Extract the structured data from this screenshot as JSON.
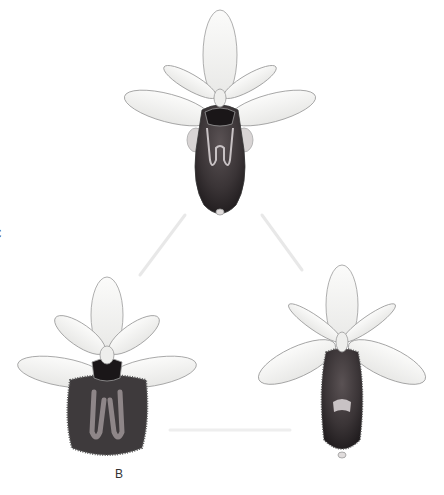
{
  "figure": {
    "background": "#ffffff",
    "specimens": [
      {
        "id": "C",
        "label": "C",
        "position": "top-center",
        "lip_style": "elongated dark lip with pale H-shaped speculum"
      },
      {
        "id": "A",
        "label": "A",
        "position": "bottom-left",
        "lip_style": "broad hairy dark lip with pale branched speculum"
      },
      {
        "id": "B",
        "label": "B",
        "position": "bottom-right",
        "lip_style": "dark hairy lip with small pale speculum"
      }
    ],
    "colors": {
      "petal_fill": "#f4f4f2",
      "petal_outline": "#9a9a9a",
      "lip_dark": "#2e2a2c",
      "lip_mid": "#4a4446",
      "speculum": "#b8b2b4",
      "connector": "#e6e6e6",
      "label": "#333333"
    }
  }
}
